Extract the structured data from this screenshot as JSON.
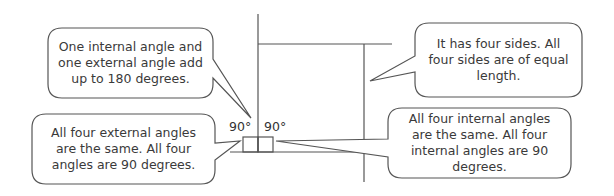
{
  "diagram": {
    "callouts": [
      {
        "id": "angle-sum",
        "text": "One internal angle and one external angle add up to 180 degrees."
      },
      {
        "id": "sides",
        "text": "It has four sides. All four sides are of equal length."
      },
      {
        "id": "external-angles",
        "text": "All four external angles are the same. All four angles are 90 degrees."
      },
      {
        "id": "internal-angles",
        "text": "All four internal angles are the same. All four internal angles are 90 degrees."
      }
    ],
    "angle_labels": [
      "90°",
      "90°"
    ],
    "colors": {
      "line": "#555555",
      "text": "#3a3a3a",
      "background": "#ffffff"
    }
  }
}
